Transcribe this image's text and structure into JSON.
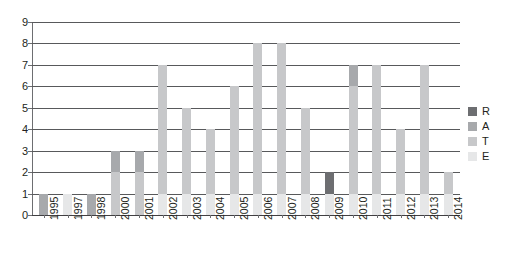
{
  "chart_data": {
    "type": "bar",
    "stacked": true,
    "title": "",
    "subtitle": "",
    "xlabel": "",
    "ylabel": "",
    "ylim": [
      0,
      9
    ],
    "yticks": [
      0,
      1,
      2,
      3,
      4,
      5,
      6,
      7,
      8,
      9
    ],
    "grid": "horizontal",
    "legend_position": "right",
    "categories": [
      "1995",
      "1997",
      "1998",
      "2000",
      "2001",
      "2002",
      "2003",
      "2004",
      "2005",
      "2006",
      "2007",
      "2008",
      "2009",
      "2010",
      "2011",
      "2012",
      "2013",
      "2014"
    ],
    "series": [
      {
        "name": "R",
        "color": "#6d6e71",
        "values": [
          0,
          0,
          0,
          0,
          0,
          0,
          0,
          0,
          0,
          0,
          0,
          0,
          1,
          0,
          0,
          0,
          0,
          0
        ]
      },
      {
        "name": "A",
        "color": "#a7a9ac",
        "values": [
          1,
          0,
          1,
          1,
          1,
          0,
          0,
          0,
          0,
          0,
          0,
          0,
          0,
          1,
          0,
          0,
          0,
          0
        ]
      },
      {
        "name": "T",
        "color": "#c7c8ca",
        "values": [
          0,
          0,
          0,
          2,
          2,
          6,
          4,
          3,
          5,
          7,
          7,
          4,
          0,
          5,
          6,
          3,
          6,
          1
        ]
      },
      {
        "name": "E",
        "color": "#e6e7e8",
        "values": [
          0,
          1,
          0,
          0,
          0,
          1,
          1,
          1,
          1,
          1,
          1,
          1,
          1,
          1,
          1,
          1,
          1,
          1
        ]
      }
    ],
    "totals": [
      1,
      1,
      1,
      3,
      3,
      7,
      5,
      4,
      6,
      8,
      8,
      5,
      2,
      7,
      7,
      4,
      7,
      2
    ]
  },
  "legend": {
    "items": [
      {
        "label": "R",
        "color": "#6d6e71"
      },
      {
        "label": "A",
        "color": "#a7a9ac"
      },
      {
        "label": "T",
        "color": "#c7c8ca"
      },
      {
        "label": "E",
        "color": "#e6e7e8"
      }
    ]
  },
  "axes": {
    "y_tick_labels": [
      "0",
      "1",
      "2",
      "3",
      "4",
      "5",
      "6",
      "7",
      "8",
      "9"
    ],
    "x_tick_labels": [
      "1995",
      "1997",
      "1998",
      "2000",
      "2001",
      "2002",
      "2003",
      "2004",
      "2005",
      "2006",
      "2007",
      "2008",
      "2009",
      "2010",
      "2011",
      "2012",
      "2013",
      "2014"
    ]
  },
  "colors": {
    "gridline": "#58595b",
    "axis": "#6d6e71",
    "text": "#231f20",
    "background": "#ffffff"
  }
}
